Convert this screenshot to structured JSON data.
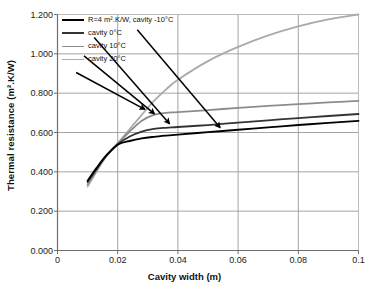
{
  "chart_data": {
    "type": "line",
    "title": "",
    "xlabel": "Cavity width (m)",
    "ylabel": "Thermal resistance (m².K/W)",
    "xlim": [
      0,
      0.1
    ],
    "ylim": [
      0.0,
      1.2
    ],
    "xticks": [
      "0",
      "0.02",
      "0.04",
      "0.06",
      "0.08",
      "0.1"
    ],
    "xtick_values": [
      0,
      0.02,
      0.04,
      0.06,
      0.08,
      0.1
    ],
    "yticks": [
      "0.000",
      "0.200",
      "0.400",
      "0.600",
      "0.800",
      "1.000",
      "1.200"
    ],
    "ytick_values": [
      0.0,
      0.2,
      0.4,
      0.6,
      0.8,
      1.0,
      1.2
    ],
    "grid": true,
    "legend_position": "top-left",
    "series": [
      {
        "name": "R=4 m².K/W, cavity -10°C",
        "color": "#000000",
        "width": 1.9,
        "x": [
          0.01,
          0.013,
          0.016,
          0.02,
          0.024,
          0.028,
          0.032,
          0.036,
          0.04,
          0.05,
          0.06,
          0.07,
          0.08,
          0.09,
          0.1
        ],
        "y": [
          0.355,
          0.42,
          0.48,
          0.538,
          0.557,
          0.57,
          0.578,
          0.584,
          0.589,
          0.602,
          0.614,
          0.626,
          0.638,
          0.649,
          0.659
        ]
      },
      {
        "name": "cavity 0°C",
        "color": "#333333",
        "width": 1.8,
        "x": [
          0.01,
          0.013,
          0.016,
          0.02,
          0.024,
          0.028,
          0.032,
          0.036,
          0.04,
          0.05,
          0.06,
          0.07,
          0.08,
          0.09,
          0.1
        ],
        "y": [
          0.348,
          0.415,
          0.478,
          0.54,
          0.58,
          0.605,
          0.618,
          0.624,
          0.628,
          0.638,
          0.65,
          0.662,
          0.673,
          0.684,
          0.694
        ]
      },
      {
        "name": "cavity 10°C",
        "color": "#8c8c8c",
        "width": 1.8,
        "x": [
          0.01,
          0.013,
          0.016,
          0.02,
          0.024,
          0.028,
          0.032,
          0.036,
          0.04,
          0.05,
          0.06,
          0.07,
          0.08,
          0.09,
          0.1
        ],
        "y": [
          0.335,
          0.408,
          0.476,
          0.543,
          0.605,
          0.66,
          0.69,
          0.7,
          0.704,
          0.714,
          0.725,
          0.735,
          0.744,
          0.753,
          0.761
        ]
      },
      {
        "name": "cavity 20°C",
        "color": "#aaaaaa",
        "width": 1.8,
        "x": [
          0.01,
          0.013,
          0.016,
          0.02,
          0.024,
          0.028,
          0.032,
          0.036,
          0.04,
          0.05,
          0.06,
          0.07,
          0.08,
          0.09,
          0.1
        ],
        "y": [
          0.325,
          0.402,
          0.474,
          0.545,
          0.618,
          0.69,
          0.76,
          0.818,
          0.868,
          0.963,
          1.035,
          1.094,
          1.14,
          1.175,
          1.2
        ]
      }
    ],
    "annotations": [
      {
        "name": "arrow-cavity-20c",
        "from_x": 0.0062,
        "from_y": 0.905,
        "to_x": 0.029,
        "to_y": 0.718
      },
      {
        "name": "arrow-cavity-10c",
        "from_x": 0.0088,
        "from_y": 0.99,
        "to_x": 0.0322,
        "to_y": 0.695
      },
      {
        "name": "arrow-cavity-0c",
        "from_x": 0.0122,
        "from_y": 1.083,
        "to_x": 0.0372,
        "to_y": 0.645
      },
      {
        "name": "arrow-cavity-minus-10c",
        "from_x": 0.0265,
        "from_y": 1.122,
        "to_x": 0.054,
        "to_y": 0.625
      }
    ]
  },
  "axes": {
    "x_title": "Cavity width (m)",
    "y_title": "Thermal resistance (m².K/W)"
  },
  "legend": {
    "items": [
      {
        "label": "R=4 m².K/W, cavity -10°C",
        "color": "#000000",
        "thickness": 2.4
      },
      {
        "label": "cavity 0°C",
        "color": "#333333",
        "thickness": 2.1
      },
      {
        "label": "cavity 10°C",
        "color": "#8c8c8c",
        "thickness": 1.9
      },
      {
        "label": "cavity 20°C",
        "color": "#aaaaaa",
        "thickness": 1.7
      }
    ]
  },
  "style": {
    "plot_bg": "#ffffff",
    "grid_color": "#9a9a9a",
    "axis_color": "#6e6e6e",
    "text_color": "#1a1a1a",
    "arrow_color": "#000000"
  }
}
